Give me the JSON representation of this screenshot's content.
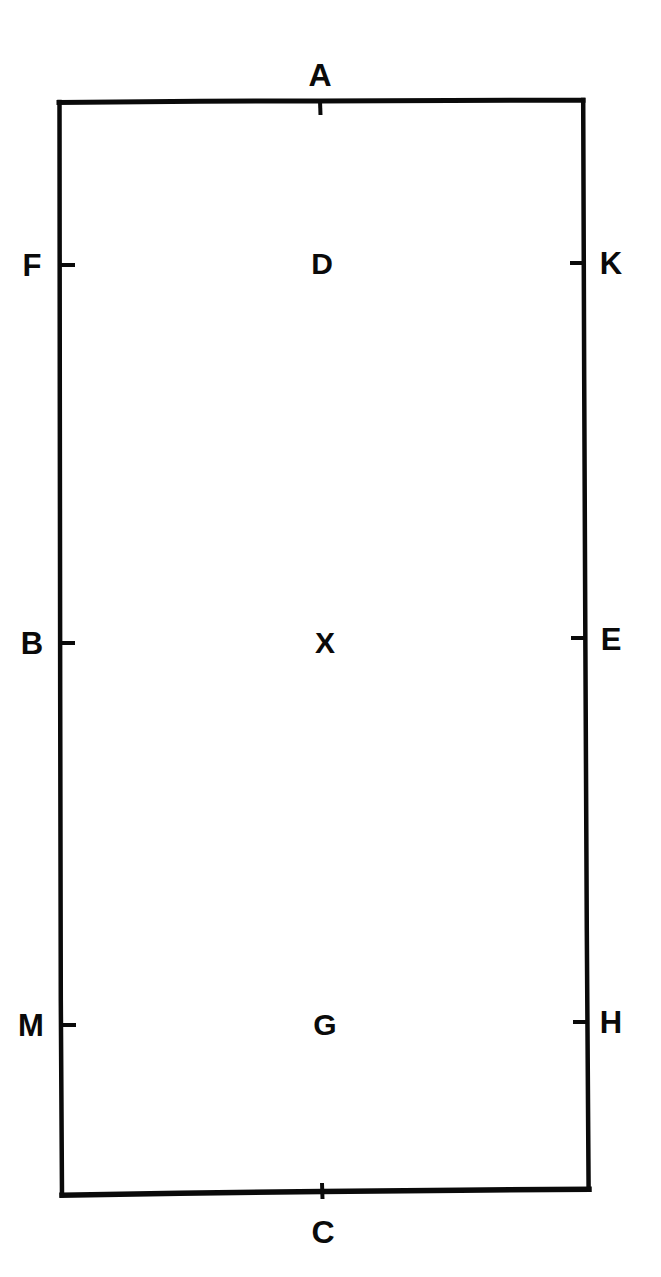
{
  "figure": {
    "type": "geometry-diagram",
    "shape": "rectangle",
    "stroke_color": "#0a0a0a",
    "background_color": "#ffffff"
  },
  "rectangle": {
    "top_left": {
      "x": 59,
      "y": 102
    },
    "top_right": {
      "x": 583,
      "y": 100
    },
    "bottom_right": {
      "x": 589,
      "y": 1189
    },
    "bottom_left": {
      "x": 62,
      "y": 1195
    }
  },
  "labels": {
    "apex_top": {
      "text": "A",
      "x": 320,
      "y": 75,
      "side": "top",
      "role": "tick-label"
    },
    "apex_bottom": {
      "text": "C",
      "x": 323,
      "y": 1232,
      "side": "bottom",
      "role": "tick-label"
    },
    "left_upper": {
      "text": "F",
      "x": 32,
      "y": 265,
      "side": "left",
      "role": "tick-label"
    },
    "left_middle": {
      "text": "B",
      "x": 32,
      "y": 643,
      "side": "left",
      "role": "tick-label"
    },
    "left_lower": {
      "text": "M",
      "x": 31,
      "y": 1025,
      "side": "left",
      "role": "tick-label"
    },
    "right_upper": {
      "text": "K",
      "x": 611,
      "y": 263,
      "side": "right",
      "role": "tick-label"
    },
    "right_middle": {
      "text": "E",
      "x": 611,
      "y": 639,
      "side": "right",
      "role": "tick-label"
    },
    "right_lower": {
      "text": "H",
      "x": 611,
      "y": 1022,
      "side": "right",
      "role": "tick-label"
    },
    "interior_upper": {
      "text": "D",
      "x": 322,
      "y": 264,
      "side": "interior",
      "role": "point-label"
    },
    "interior_center": {
      "text": "X",
      "x": 325,
      "y": 643,
      "side": "interior",
      "role": "point-label"
    },
    "interior_lower": {
      "text": "G",
      "x": 325,
      "y": 1025,
      "side": "interior",
      "role": "point-label"
    }
  },
  "ticks": {
    "top": {
      "x": 320,
      "y": 101,
      "direction": "inward-down",
      "length": 14
    },
    "bottom": {
      "x": 322,
      "y": 1191,
      "direction": "both-vertical",
      "length": 13
    },
    "left_upper": {
      "x": 60,
      "y": 265,
      "direction": "inward-right",
      "length": 14
    },
    "left_middle": {
      "x": 60,
      "y": 643,
      "direction": "inward-right",
      "length": 14
    },
    "left_lower": {
      "x": 61,
      "y": 1025,
      "direction": "inward-right",
      "length": 14
    },
    "right_upper": {
      "x": 585,
      "y": 263,
      "direction": "inward-left",
      "length": 14
    },
    "right_middle": {
      "x": 586,
      "y": 638,
      "direction": "inward-left",
      "length": 14
    },
    "right_lower": {
      "x": 588,
      "y": 1022,
      "direction": "inward-left",
      "length": 14
    }
  }
}
